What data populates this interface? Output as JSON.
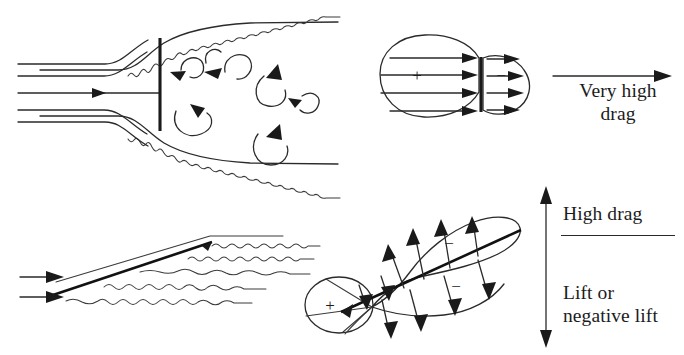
{
  "figure": {
    "background_color": "#ffffff",
    "line_color": "#2a2a2a"
  },
  "panels": {
    "top_left": {
      "name": "blunt-plate-in-duct-separated-flow",
      "description": "Streamlines entering a duct, a normal flat plate, and recirculating vortices downstream with turbulent wavy walls",
      "streamline_count": 5,
      "vortex_count": 7,
      "plate_orientation": "normal-to-flow"
    },
    "top_right": {
      "name": "blunt-body-pressure-distribution",
      "description": "Rounded blunt body split by a vertical line with pressure arrows on both faces",
      "front_sign": "+",
      "rear_sign": "−",
      "front_arrow_count": 4,
      "rear_arrow_count": 4,
      "result_arrow_direction": "right",
      "caption_line1": "Very high",
      "caption_line2": "drag"
    },
    "bottom_left": {
      "name": "inclined-plate-separated-flow",
      "description": "Inclined flat plate with attached streamline above and turbulent wavy wake below",
      "inflow_arrow_count": 2,
      "wavy_wake_lines": 5,
      "plate_orientation": "inclined"
    },
    "bottom_right": {
      "name": "inclined-plate-pressure-distribution",
      "description": "Inclined plate with a positive-pressure circle at the leading edge and a large suction lobe with negative pressure arrows",
      "front_sign": "+",
      "upper_sign": "−",
      "lower_sign": "−",
      "caption_upper": "High drag",
      "caption_lower_line1": "Lift or",
      "caption_lower_line2": "negative lift",
      "result_arrow_direction": "vertical-double"
    }
  }
}
